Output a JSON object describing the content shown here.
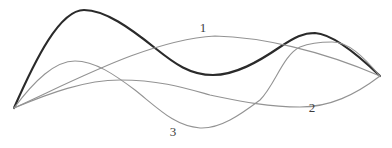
{
  "figure": {
    "background_color": "#ffffff",
    "canvas": {
      "width": 392,
      "height": 148
    },
    "curves": [
      {
        "name": "thick-curve",
        "label": "",
        "color": "#2a2a2a",
        "stroke_width": 2.2,
        "path": "M 14 108 C 36 58 60 10 84 10 C 105 10 130 28 155 48 C 175 64 190 75 213 75 C 235 75 258 62 280 47 C 295 37 303 33 315 33 C 332 34 355 52 380 76"
      },
      {
        "name": "curve-1",
        "label": "1",
        "color": "#939393",
        "stroke_width": 1.1,
        "path": "M 14 108 C 80 78 150 40 215 36 C 260 37 320 50 380 76"
      },
      {
        "name": "curve-2",
        "label": "2",
        "color": "#939393",
        "stroke_width": 1.1,
        "path": "M 14 108 C 50 93 85 80 120 80 C 160 80 185 88 210 95 C 235 100 265 107 300 107 C 330 107 355 95 380 76"
      },
      {
        "name": "curve-3",
        "label": "3",
        "color": "#939393",
        "stroke_width": 1.1,
        "path": "M 14 108 C 35 80 55 61 75 61 C 95 61 115 75 135 90 C 160 110 175 126 200 128 C 220 129 240 115 260 100 C 275 85 283 55 300 47 C 310 43 320 42 332 42 C 348 42 362 55 380 76"
      }
    ],
    "labels": [
      {
        "text": "1",
        "x": 203,
        "y": 27
      },
      {
        "text": "2",
        "x": 312,
        "y": 107
      },
      {
        "text": "3",
        "x": 173,
        "y": 131
      }
    ]
  }
}
